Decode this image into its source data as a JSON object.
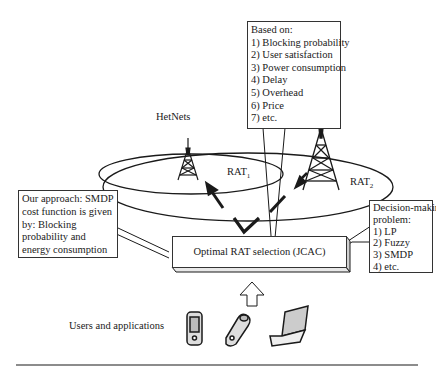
{
  "criteria_box": {
    "lines": [
      "Based on:",
      "1) Blocking probability",
      "2) User satisfaction",
      "3) Power consumption",
      "4) Delay",
      "5) Overhead",
      "6) Price",
      "7) etc."
    ]
  },
  "hetnets_label": "HetNets",
  "rat1": {
    "base": "RAT",
    "sub": "1"
  },
  "rat2": {
    "base": "RAT",
    "sub": "2"
  },
  "approach_box": {
    "lines": [
      "Our approach: SMDP",
      "cost function is given",
      "by: Blocking",
      "probability and",
      "energy consumption"
    ]
  },
  "decision_box": {
    "lines": [
      "Decision-making",
      "problem:",
      "1) LP",
      "2) Fuzzy",
      "3) SMDP",
      "4) etc."
    ]
  },
  "selection_block": {
    "label": "Optimal RAT selection (JCAC)"
  },
  "users_label": "Users and applications",
  "devices": [
    "pda-device",
    "flip-phone",
    "laptop"
  ],
  "colors": {
    "line": "#1a1a1a",
    "background": "#ffffff"
  }
}
